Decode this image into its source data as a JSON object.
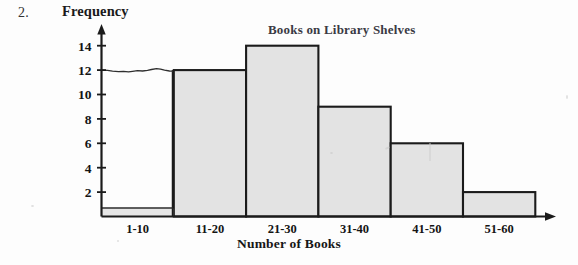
{
  "problem": {
    "number": "2."
  },
  "chart_data": {
    "type": "bar",
    "title": "Books on Library Shelves",
    "xlabel": "Number of Books",
    "ylabel": "Frequency",
    "categories": [
      "1-10",
      "11-20",
      "21-30",
      "31-40",
      "41-50",
      "51-60"
    ],
    "values": [
      12,
      12,
      14,
      9,
      6,
      2
    ],
    "yticks": [
      "2",
      "4",
      "6",
      "8",
      "10",
      "12",
      "14"
    ],
    "ytick_values": [
      2,
      4,
      6,
      8,
      10,
      12,
      14
    ],
    "ylim": [
      0,
      15
    ],
    "grid": false,
    "legend": false,
    "bar_fill_color": "#e3e3e3",
    "bar_edge_color": "#1b1b1b",
    "axis_color": "#1b1b1b",
    "first_bar_unfilled": true,
    "first_bar_top_is_handdrawn": true
  }
}
